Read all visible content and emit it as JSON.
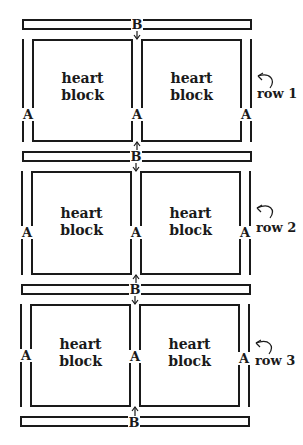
{
  "diagram": {
    "strip_label": "B",
    "sashing_label": "A",
    "block_text_line1": "heart",
    "block_text_line2": "block",
    "rows": [
      {
        "label": "row 1"
      },
      {
        "label": "row 2"
      },
      {
        "label": "row 3"
      }
    ],
    "colors": {
      "line": "#1a1a1a",
      "background": "#ffffff"
    }
  }
}
